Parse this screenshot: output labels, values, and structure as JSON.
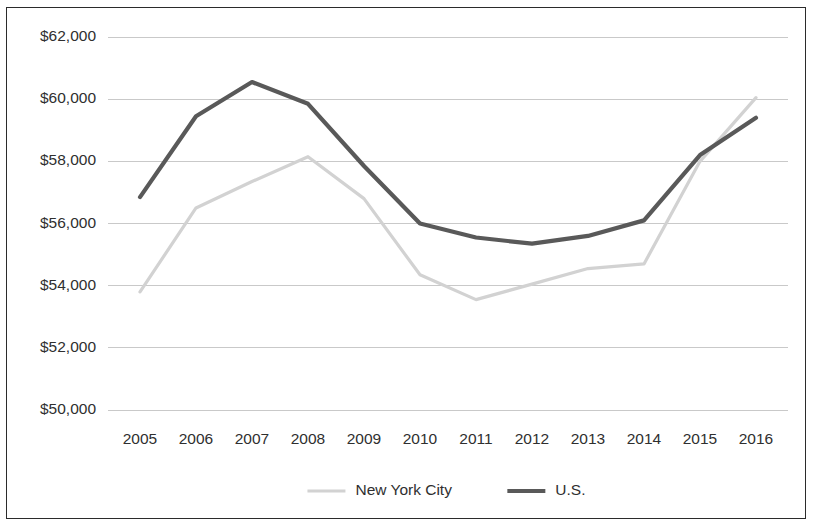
{
  "chart_data": {
    "type": "line",
    "title": "",
    "subtitle": "",
    "xlabel": "",
    "ylabel": "",
    "categories": [
      "2005",
      "2006",
      "2007",
      "2008",
      "2009",
      "2010",
      "2011",
      "2012",
      "2013",
      "2014",
      "2015",
      "2016"
    ],
    "x": [
      2005,
      2006,
      2007,
      2008,
      2009,
      2010,
      2011,
      2012,
      2013,
      2014,
      2015,
      2016
    ],
    "series": [
      {
        "name": "New York City",
        "color": "#d2d2d2",
        "values": [
          53800,
          56500,
          57350,
          58150,
          56800,
          54350,
          53550,
          54050,
          54550,
          54700,
          58000,
          60050
        ]
      },
      {
        "name": "U.S.",
        "color": "#595959",
        "values": [
          56850,
          59450,
          60550,
          59850,
          57850,
          56000,
          55550,
          55350,
          55600,
          56100,
          58200,
          59400
        ]
      }
    ],
    "ylim": [
      50000,
      62000
    ],
    "ytick_values": [
      50000,
      52000,
      54000,
      56000,
      58000,
      60000,
      62000
    ],
    "ytick_labels": [
      "$50,000",
      "$52,000",
      "$54,000",
      "$56,000",
      "$58,000",
      "$60,000",
      "$62,000"
    ],
    "grid": true,
    "grid_axis": "y",
    "legend_position": "bottom",
    "legend": [
      "New York City",
      "U.S."
    ]
  },
  "legend": {
    "entries": [
      {
        "label": "New York City",
        "color": "#d2d2d2"
      },
      {
        "label": "U.S.",
        "color": "#595959"
      }
    ]
  },
  "colors": {
    "background": "#ffffff",
    "gridline": "#c9c9c9",
    "border": "#2b2b2b",
    "text": "#2f2f2f",
    "series_new_york_city": "#d2d2d2",
    "series_us": "#595959"
  }
}
